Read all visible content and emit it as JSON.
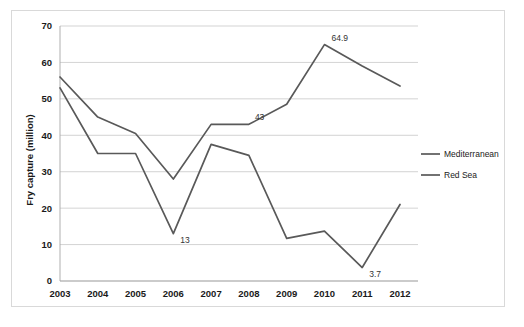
{
  "chart_data": {
    "type": "line",
    "title": "",
    "xlabel": "",
    "ylabel": "Fry capture (million)",
    "categories": [
      "2003",
      "2004",
      "2005",
      "2006",
      "2007",
      "2008",
      "2009",
      "2010",
      "2011",
      "2012"
    ],
    "ylim": [
      0,
      70
    ],
    "ytick_step": 10,
    "yticks": [
      "0",
      "10",
      "20",
      "30",
      "40",
      "50",
      "60",
      "70"
    ],
    "grid": true,
    "legend_position": "right",
    "series": [
      {
        "name": "Mediterranean",
        "color": "#595959",
        "values": [
          56.0,
          45.0,
          40.5,
          28.0,
          43.0,
          43.0,
          48.5,
          64.9,
          59.0,
          53.5
        ]
      },
      {
        "name": "Red Sea",
        "color": "#595959",
        "values": [
          53.0,
          35.0,
          35.0,
          13.0,
          37.5,
          34.5,
          11.7,
          13.7,
          3.7,
          21.0
        ]
      }
    ],
    "annotations": [
      {
        "text": "13",
        "series": "Red Sea",
        "category": "2006"
      },
      {
        "text": "43",
        "series": "Mediterranean",
        "category": "2008"
      },
      {
        "text": "64.9",
        "series": "Mediterranean",
        "category": "2010"
      },
      {
        "text": "3.7",
        "series": "Red Sea",
        "category": "2011"
      }
    ]
  },
  "legend": {
    "items": [
      {
        "label": "Mediterranean"
      },
      {
        "label": "Red Sea"
      }
    ]
  },
  "caption": {
    "text": ""
  }
}
